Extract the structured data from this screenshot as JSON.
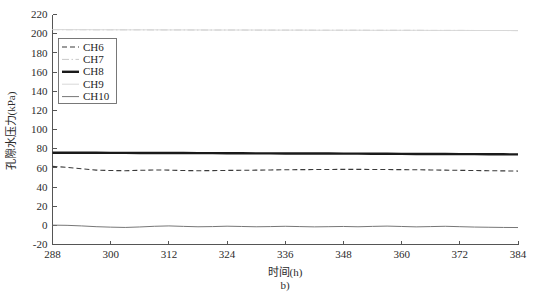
{
  "figure": {
    "caption": "b)",
    "background_color": "#ffffff",
    "axis_color": "#555555"
  },
  "chart_data": {
    "type": "line",
    "title": "",
    "subtitle": "",
    "xlabel": "时间(h)",
    "ylabel": "孔隙水压力(kPa)",
    "xlim": [
      288,
      384
    ],
    "ylim": [
      -20,
      220
    ],
    "xticks": [
      288,
      300,
      312,
      324,
      336,
      348,
      360,
      372,
      384
    ],
    "yticks": [
      -20,
      0,
      20,
      40,
      60,
      80,
      100,
      120,
      140,
      160,
      180,
      200,
      220
    ],
    "xtick_labels": [
      "288",
      "300",
      "312",
      "324",
      "336",
      "348",
      "360",
      "372",
      "384"
    ],
    "ytick_labels": [
      "-20",
      "0",
      "20",
      "40",
      "60",
      "80",
      "100",
      "120",
      "140",
      "160",
      "180",
      "200",
      "220"
    ],
    "grid": false,
    "legend_position": "upper left",
    "annotations": [
      "b)"
    ],
    "x": [
      288,
      291,
      294,
      297,
      300,
      303,
      306,
      309,
      312,
      315,
      318,
      321,
      324,
      327,
      330,
      333,
      336,
      339,
      342,
      345,
      348,
      351,
      354,
      357,
      360,
      363,
      366,
      369,
      372,
      375,
      378,
      381,
      384
    ],
    "series": [
      {
        "name": "CH6",
        "style": "dashed",
        "color": "#3a3a3a",
        "width": 1.1,
        "values": [
          61.5,
          60.5,
          59.0,
          57.6,
          57.2,
          57.0,
          57.4,
          57.8,
          57.6,
          57.2,
          57.0,
          57.1,
          57.3,
          57.4,
          57.6,
          57.8,
          58.0,
          58.1,
          58.2,
          58.3,
          58.4,
          58.4,
          58.3,
          58.2,
          58.1,
          58.0,
          57.8,
          57.6,
          57.4,
          57.2,
          57.0,
          56.8,
          56.6
        ]
      },
      {
        "name": "CH7",
        "style": "dashdot",
        "color": "#c9c9c9",
        "width": 1.0,
        "values": [
          204.2,
          204.1,
          204.1,
          204.0,
          204.0,
          204.0,
          204.0,
          203.9,
          203.9,
          203.9,
          203.8,
          203.8,
          203.8,
          203.8,
          203.7,
          203.7,
          203.7,
          203.7,
          203.6,
          203.6,
          203.6,
          203.6,
          203.5,
          203.5,
          203.5,
          203.5,
          203.4,
          203.4,
          203.4,
          203.3,
          203.3,
          203.3,
          203.2
        ]
      },
      {
        "name": "CH8",
        "style": "solid",
        "color": "#1a1a1a",
        "width": 2.4,
        "values": [
          75.8,
          75.8,
          75.7,
          75.7,
          75.6,
          75.6,
          75.5,
          75.5,
          75.4,
          75.4,
          75.3,
          75.3,
          75.2,
          75.2,
          75.1,
          75.1,
          75.0,
          75.0,
          74.9,
          74.9,
          74.8,
          74.8,
          74.7,
          74.7,
          74.6,
          74.5,
          74.5,
          74.4,
          74.3,
          74.3,
          74.2,
          74.1,
          74.0
        ]
      },
      {
        "name": "CH9",
        "style": "solid",
        "color": "#d8d8d8",
        "width": 1.0,
        "values": [
          204.3,
          204.2,
          204.2,
          204.1,
          204.1,
          204.0,
          204.0,
          204.0,
          203.9,
          203.9,
          203.9,
          203.8,
          203.8,
          203.8,
          203.8,
          203.7,
          203.7,
          203.7,
          203.6,
          203.6,
          203.6,
          203.6,
          203.5,
          203.5,
          203.5,
          203.5,
          203.4,
          203.4,
          203.4,
          203.3,
          203.3,
          203.3,
          203.2
        ]
      },
      {
        "name": "CH10",
        "style": "solid",
        "color": "#777777",
        "width": 1.0,
        "values": [
          0.2,
          0.0,
          -0.6,
          -1.4,
          -1.9,
          -2.2,
          -1.7,
          -1.0,
          -0.6,
          -1.1,
          -1.5,
          -1.3,
          -0.9,
          -1.2,
          -1.5,
          -1.3,
          -1.0,
          -1.3,
          -1.6,
          -1.4,
          -1.2,
          -1.5,
          -1.1,
          -0.8,
          -1.2,
          -1.6,
          -1.3,
          -1.0,
          -1.4,
          -1.8,
          -2.0,
          -2.2,
          -2.3
        ]
      }
    ]
  },
  "legend": {
    "entries": [
      {
        "label": "CH6"
      },
      {
        "label": "CH7"
      },
      {
        "label": "CH8"
      },
      {
        "label": "CH9"
      },
      {
        "label": "CH10"
      }
    ]
  }
}
